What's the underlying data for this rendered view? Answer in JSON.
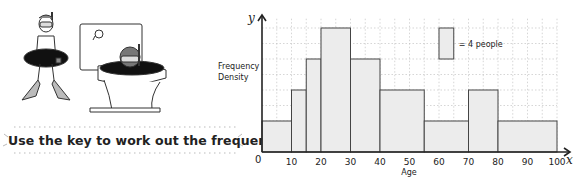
{
  "instruction": "Use the key to work out the frequencies.",
  "illustration": {
    "description": "cartoon: snorkeller with rubber ring and flippers standing beside a toilet with another snorkeller peeking out of the bowl"
  },
  "chart_data": {
    "type": "histogram",
    "title": "",
    "xlabel": "Age",
    "ylabel": "Frequency Density",
    "x_axis_symbol": "x",
    "y_axis_symbol": "y",
    "origin_label": "0",
    "x_ticks": [
      10,
      20,
      30,
      40,
      50,
      60,
      70,
      80,
      90,
      100
    ],
    "xlim": [
      0,
      100
    ],
    "grid": true,
    "key": {
      "label": "= 4 people",
      "width_years": 5,
      "height_levels": 1
    },
    "bins": [
      {
        "from": 0,
        "to": 10,
        "height_levels": 1,
        "frequency_density": 0.8,
        "frequency": 8
      },
      {
        "from": 10,
        "to": 15,
        "height_levels": 2,
        "frequency_density": 1.6,
        "frequency": 8
      },
      {
        "from": 15,
        "to": 20,
        "height_levels": 3,
        "frequency_density": 2.4,
        "frequency": 12
      },
      {
        "from": 20,
        "to": 30,
        "height_levels": 4,
        "frequency_density": 3.2,
        "frequency": 32
      },
      {
        "from": 30,
        "to": 40,
        "height_levels": 3,
        "frequency_density": 2.4,
        "frequency": 24
      },
      {
        "from": 40,
        "to": 55,
        "height_levels": 2,
        "frequency_density": 1.6,
        "frequency": 24
      },
      {
        "from": 55,
        "to": 70,
        "height_levels": 1,
        "frequency_density": 0.8,
        "frequency": 12
      },
      {
        "from": 70,
        "to": 80,
        "height_levels": 2,
        "frequency_density": 1.6,
        "frequency": 16
      },
      {
        "from": 80,
        "to": 100,
        "height_levels": 1,
        "frequency_density": 0.8,
        "frequency": 16
      }
    ],
    "colors": {
      "bar_fill": "#ececec",
      "bar_stroke": "#444444",
      "grid": "#bbbbbb",
      "axis": "#222222"
    }
  }
}
